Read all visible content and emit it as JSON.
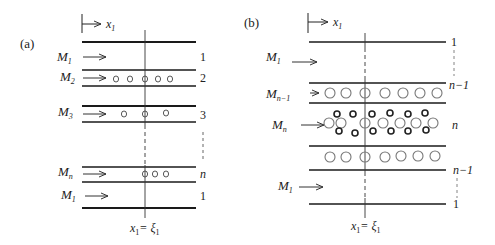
{
  "panel_a": {
    "label": "(a)",
    "axis_label": "x",
    "axis_sub": "1",
    "bottom_label": "x",
    "bottom_sub": "1",
    "bottom_eq": "= ξ",
    "bottom_eq_sub": "1",
    "layers": [
      {
        "flow": "M",
        "flow_sub": "1",
        "index": "1",
        "bubbles": 0
      },
      {
        "flow": "M",
        "flow_sub": "2",
        "index": "2",
        "bubbles": 5
      },
      {
        "flow": "M",
        "flow_sub": "3",
        "index": "3",
        "bubbles": 3
      },
      {
        "flow": "M",
        "flow_sub": "n",
        "index": "n",
        "bubbles": 3
      },
      {
        "flow": "M",
        "flow_sub": "1",
        "index": "1",
        "bubbles": 0
      }
    ]
  },
  "panel_b": {
    "label": "(b)",
    "axis_label": "x",
    "axis_sub": "1",
    "bottom_label": "x",
    "bottom_sub": "1",
    "bottom_eq": "= ξ",
    "bottom_eq_sub": "1",
    "flows": [
      {
        "flow": "M",
        "flow_sub": "1"
      },
      {
        "flow": "M",
        "flow_sub": "n−1"
      },
      {
        "flow": "M",
        "flow_sub": "n"
      },
      {
        "flow": "M",
        "flow_sub": "1"
      }
    ],
    "indices": [
      "1",
      "n−1",
      "n",
      "n−1",
      "1"
    ]
  },
  "colors": {
    "line": "#1a1a1a",
    "bubble_light": "#777777",
    "bubble_dark": "#222222"
  }
}
